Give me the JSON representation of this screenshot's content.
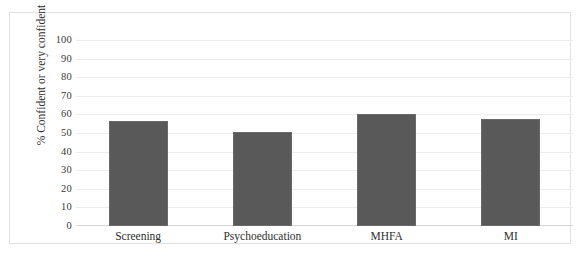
{
  "figure": {
    "clipped_title_fragment": "",
    "background_color": "#ffffff",
    "frame_color": "#e2e2e2"
  },
  "chart_data": {
    "type": "bar",
    "title": "",
    "categories": [
      "Screening",
      "Psychoeducation",
      "MHFA",
      "MI"
    ],
    "values": [
      57,
      51,
      60.5,
      58
    ],
    "series": [
      {
        "name": "% Confident or very confident",
        "values": [
          57,
          51,
          60.5,
          58
        ]
      }
    ],
    "xlabel": "",
    "ylabel": "% Confident or very confident",
    "ylim": [
      0,
      100
    ],
    "ytick_labels": [
      "100",
      "90",
      "80",
      "70",
      "60",
      "50",
      "40",
      "30",
      "20",
      "10",
      "0"
    ],
    "ytick_values": [
      100,
      90,
      80,
      70,
      60,
      50,
      40,
      30,
      20,
      10,
      0
    ],
    "grid": true,
    "grid_axis": "y",
    "legend": false,
    "legend_position": "none",
    "bar_color": "#595959",
    "bar_border_color": "#6a6a6a",
    "gridline_color": "#eceded",
    "axis_color": "#d4d6d8"
  }
}
